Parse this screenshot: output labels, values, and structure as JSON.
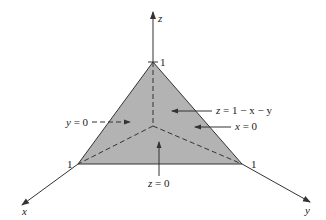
{
  "diagram": {
    "colors": {
      "fill": "#b3b3b3",
      "stroke": "#333333",
      "text": "#222222"
    },
    "axes": {
      "x": {
        "label": "x",
        "tick_label": "1"
      },
      "y": {
        "label": "y",
        "tick_label": "1"
      },
      "z": {
        "label": "z",
        "tick_label": "1"
      }
    },
    "annotations": [
      {
        "id": "y0",
        "prefix": "y",
        "text": " = 0"
      },
      {
        "id": "plane",
        "prefix": "z",
        "text": " = 1 − x − y"
      },
      {
        "id": "x0",
        "prefix": "x",
        "text": " = 0"
      },
      {
        "id": "z0",
        "prefix": "z",
        "text": " = 0"
      }
    ]
  }
}
